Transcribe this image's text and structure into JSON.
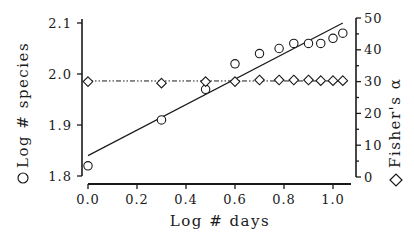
{
  "chart_data": {
    "type": "scatter",
    "title": "",
    "xlabel": "Log # days",
    "ylabel": "Log # species",
    "ylabel_marker": "circle",
    "y2label": "Fisher's α",
    "y2label_marker": "diamond",
    "xlim": [
      0.0,
      1.07
    ],
    "ylim": [
      1.8,
      2.1
    ],
    "y2lim": [
      0,
      50
    ],
    "x_ticks": [
      "0.0",
      "0.2",
      "0.4",
      "0.6",
      "0.8",
      "1.0"
    ],
    "y_ticks": [
      "1.8",
      "1.9",
      "2.0",
      "2.1"
    ],
    "y2_ticks": [
      "0",
      "10",
      "20",
      "30",
      "40",
      "50"
    ],
    "grid": false,
    "series": [
      {
        "name": "Log # species",
        "marker": "circle",
        "axis": "left",
        "x": [
          0.0,
          0.3,
          0.48,
          0.6,
          0.7,
          0.78,
          0.84,
          0.9,
          0.95,
          1.0,
          1.04
        ],
        "values": [
          1.82,
          1.91,
          1.97,
          2.02,
          2.04,
          2.05,
          2.06,
          2.06,
          2.06,
          2.07,
          2.08
        ]
      },
      {
        "name": "Fisher's α",
        "marker": "diamond",
        "axis": "right",
        "x": [
          0.0,
          0.3,
          0.48,
          0.6,
          0.7,
          0.78,
          0.84,
          0.9,
          0.95,
          1.0,
          1.04
        ],
        "values": [
          30.0,
          29.5,
          30.0,
          30.0,
          30.5,
          30.5,
          30.5,
          30.5,
          30.3,
          30.3,
          30.3
        ]
      }
    ],
    "lines": [
      {
        "name": "species regression",
        "style": "solid",
        "axis": "left",
        "x": [
          0.0,
          1.04
        ],
        "y": [
          1.84,
          2.1
        ]
      },
      {
        "name": "alpha mean",
        "style": "dash-dot-dot",
        "axis": "right",
        "x": [
          0.0,
          1.04
        ],
        "y": [
          30.2,
          30.2
        ]
      }
    ]
  }
}
